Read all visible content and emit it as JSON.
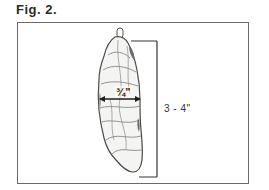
{
  "figure": {
    "caption": "Fig. 2.",
    "dimensions": {
      "width_label": "¾\"",
      "length_label": "3 - 4\""
    },
    "colors": {
      "frame": "#6a6a6a",
      "outline": "#4a4a4a",
      "shading": "#8a8a8a",
      "dimension_line": "#1e1e1e"
    }
  }
}
